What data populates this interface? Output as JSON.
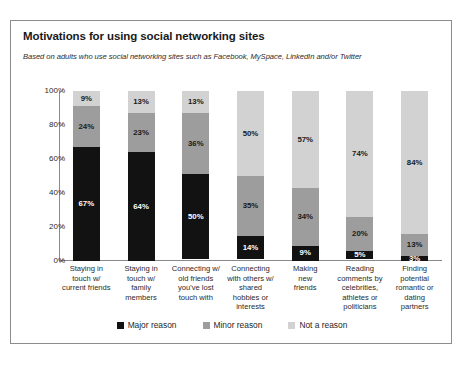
{
  "chart_data": {
    "type": "bar",
    "subtype": "stacked-bar-100",
    "title": "Motivations for using social networking sites",
    "subtitle": "Based on adults who use social networking sites such as Facebook, MySpace, LinkedIn and/or Twitter",
    "xlabel": "",
    "ylabel": "",
    "ylim": [
      0,
      100
    ],
    "ytick_labels": [
      "100%",
      "80%",
      "60%",
      "40%",
      "20%",
      "0%"
    ],
    "ytick_values": [
      100,
      80,
      60,
      40,
      20,
      0
    ],
    "grid": false,
    "legend_position": "bottom",
    "categories": [
      "Staying in touch w/ current friends",
      "Staying in touch w/ family members",
      "Connecting w/ old friends you've lost touch with",
      "Connecting with others w/ shared hobbies or interests",
      "Making new friends",
      "Reading comments by celebrities, athletes or politicians",
      "Finding potential romantic or dating partners"
    ],
    "category_lines": [
      [
        "Staying in",
        "touch w/",
        "current friends"
      ],
      [
        "Staying in",
        "touch w/",
        "family",
        "members"
      ],
      [
        "Connecting w/",
        "old friends",
        "you've lost",
        "touch with"
      ],
      [
        "Connecting",
        "with others w/",
        "shared",
        "hobbies or",
        "interests"
      ],
      [
        "Making",
        "new",
        "friends"
      ],
      [
        "Reading",
        "comments by",
        "celebrities,",
        "athletes or",
        "politicians"
      ],
      [
        "Finding",
        "potential",
        "romantic or",
        "dating",
        "partners"
      ]
    ],
    "series": [
      {
        "name": "Major reason",
        "color": "#121212",
        "values": [
          67,
          64,
          50,
          14,
          9,
          5,
          3
        ],
        "labels": [
          "67%",
          "64%",
          "50%",
          "14%",
          "9%",
          "5%",
          "3%"
        ]
      },
      {
        "name": "Minor reason",
        "color": "#9d9d9d",
        "values": [
          24,
          23,
          36,
          35,
          34,
          20,
          13
        ],
        "labels": [
          "24%",
          "23%",
          "36%",
          "35%",
          "34%",
          "20%",
          "13%"
        ]
      },
      {
        "name": "Not a reason",
        "color": "#d2d2d2",
        "values": [
          9,
          13,
          13,
          50,
          57,
          74,
          84
        ],
        "labels": [
          "9%",
          "13%",
          "13%",
          "50%",
          "57%",
          "74%",
          "84%"
        ]
      }
    ]
  },
  "legend": {
    "items": [
      {
        "label": "Major reason",
        "color": "#121212"
      },
      {
        "label": "Minor reason",
        "color": "#9d9d9d"
      },
      {
        "label": "Not a reason",
        "color": "#d2d2d2"
      }
    ]
  }
}
